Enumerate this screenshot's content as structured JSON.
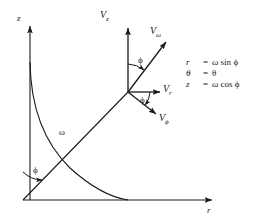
{
  "figure": {
    "type": "vector-decomposition-diagram",
    "background_color": "#ffffff",
    "line_color": "#1a1a1a"
  },
  "axes": {
    "vertical": {
      "label": "z",
      "name": "z-axis"
    },
    "horizontal": {
      "label": "r",
      "name": "r-axis"
    }
  },
  "arc": {
    "label": "",
    "name": "quarter-circle-arc"
  },
  "radius_line": {
    "label": "ω",
    "name": "omega-radius-line"
  },
  "vectors": [
    {
      "key": "vz",
      "base": "V",
      "sub": "z",
      "name": "v-z-vector"
    },
    {
      "key": "vw",
      "base": "V",
      "sub": "ω",
      "name": "v-omega-vector"
    },
    {
      "key": "vr",
      "base": "V",
      "sub": "r",
      "name": "v-r-vector"
    },
    {
      "key": "vphi",
      "base": "V",
      "sub": "ϕ",
      "name": "v-phi-vector"
    }
  ],
  "angles": [
    {
      "key": "phi_origin",
      "label": "ϕ",
      "name": "phi-angle-at-origin"
    },
    {
      "key": "phi_upper",
      "label": "ϕ",
      "name": "phi-angle-upper"
    },
    {
      "key": "phi_lower",
      "label": "ϕ",
      "name": "phi-angle-lower"
    }
  ],
  "equations": [
    {
      "lhs": "r",
      "eq": "=",
      "rhs_coef": "ω",
      "rhs_fn": "sin",
      "rhs_var": "ϕ"
    },
    {
      "lhs": "θ",
      "eq": "=",
      "rhs_coef": "θ",
      "rhs_fn": "",
      "rhs_var": ""
    },
    {
      "lhs": "z",
      "eq": "=",
      "rhs_coef": "ω",
      "rhs_fn": "cos",
      "rhs_var": "ϕ"
    }
  ]
}
